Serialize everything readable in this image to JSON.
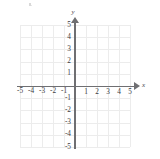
{
  "graph": {
    "title": "",
    "axis_labels": {
      "x": "x",
      "y": "y"
    },
    "x_ticks_negative": [
      "-5",
      "-4",
      "-3",
      "-2",
      "-1"
    ],
    "x_ticks_positive": [
      "1",
      "2",
      "3",
      "4",
      "5"
    ],
    "y_ticks_positive": [
      "5",
      "4",
      "3",
      "2",
      "1"
    ],
    "y_ticks_negative": [
      "-1",
      "-2",
      "-3",
      "-4",
      "-5"
    ],
    "colors": {
      "grid": "#ececec",
      "axis": "#6f6f72",
      "label": "#3c3c3f",
      "background": "#ffffff"
    }
  },
  "chart_data": {
    "type": "scatter",
    "title": "",
    "xlabel": "x",
    "ylabel": "y",
    "xlim": [
      -5,
      5
    ],
    "ylim": [
      -5,
      5
    ],
    "xticks": [
      -5,
      -4,
      -3,
      -2,
      -1,
      1,
      2,
      3,
      4,
      5
    ],
    "yticks": [
      -5,
      -4,
      -3,
      -2,
      -1,
      1,
      2,
      3,
      4,
      5
    ],
    "grid": true,
    "legend": "none",
    "series": [],
    "annotations": []
  }
}
